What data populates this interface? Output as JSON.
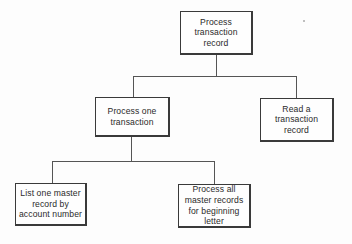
{
  "diagram": {
    "type": "hierarchy-chart",
    "nodes": {
      "root": {
        "label": "Process\ntransaction\nrecord"
      },
      "process_one": {
        "label": "Process one\ntransaction"
      },
      "read_record": {
        "label": "Read a\ntransaction\nrecord"
      },
      "list_master": {
        "label": "List one master\nrecord by\naccount number"
      },
      "process_all": {
        "label": "Process all\nmaster records\nfor beginning\nletter"
      }
    },
    "edges": [
      {
        "from": "root",
        "to": "process_one"
      },
      {
        "from": "root",
        "to": "read_record"
      },
      {
        "from": "process_one",
        "to": "list_master"
      },
      {
        "from": "process_one",
        "to": "process_all"
      }
    ]
  }
}
